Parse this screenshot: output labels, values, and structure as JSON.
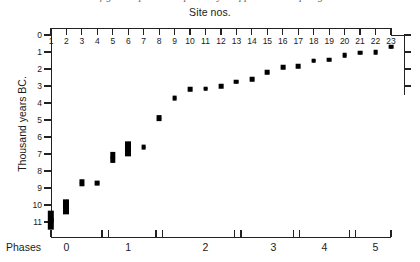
{
  "caption_clipped": "a figure caption line partially cropped at the top edge",
  "header": {
    "site_axis_title": "Site nos."
  },
  "axes": {
    "y_label": "Thousand years BC.",
    "y_ticks": [
      "0",
      "1",
      "2",
      "3",
      "4",
      "5",
      "6",
      "7",
      "8",
      "9",
      "10",
      "11"
    ],
    "y_min": 0,
    "y_max": 11,
    "y_inverted": true,
    "x_label": "Site nos.",
    "x_ticks": [
      "1",
      "2",
      "3",
      "4",
      "5",
      "6",
      "7",
      "8",
      "9",
      "10",
      "11",
      "12",
      "13",
      "14",
      "15",
      "16",
      "17",
      "18",
      "19",
      "20",
      "21",
      "22",
      "23"
    ],
    "phases_caption": "Phases",
    "phase_labels": [
      "0",
      "1",
      "2",
      "3",
      "4",
      "5"
    ]
  },
  "chart_data": {
    "type": "scatter",
    "title": "Site nos.",
    "xlabel": "Site nos.",
    "ylabel": "Thousand years BC.",
    "xlim": [
      1,
      23
    ],
    "ylim": [
      0,
      11
    ],
    "y_axis_inverted": true,
    "grid": false,
    "legend": "none",
    "marker": "vertical-diamond",
    "marker_color": "#000000",
    "categories": [
      "1",
      "2",
      "3",
      "4",
      "5",
      "6",
      "7",
      "8",
      "9",
      "10",
      "11",
      "12",
      "13",
      "14",
      "15",
      "16",
      "17",
      "18",
      "19",
      "20",
      "21",
      "22",
      "23"
    ],
    "values": [
      10.9,
      10.1,
      8.7,
      8.7,
      7.2,
      6.7,
      6.6,
      4.9,
      3.7,
      3.2,
      3.15,
      3.0,
      2.75,
      2.6,
      2.2,
      1.9,
      1.85,
      1.5,
      1.45,
      1.2,
      1.05,
      1.0,
      0.7
    ],
    "marker_half_heights": [
      0.55,
      0.45,
      0.22,
      0.14,
      0.3,
      0.45,
      0.14,
      0.17,
      0.14,
      0.12,
      0.12,
      0.12,
      0.12,
      0.12,
      0.12,
      0.12,
      0.12,
      0.12,
      0.12,
      0.12,
      0.12,
      0.12,
      0.12
    ],
    "secondary_axis": {
      "name": "Phases",
      "labels": [
        "0",
        "1",
        "2",
        "3",
        "4",
        "5"
      ],
      "label_positions_site": [
        2.0,
        6.0,
        11.0,
        15.4,
        18.7,
        22.0
      ],
      "boundaries_site": [
        1.0,
        4.3,
        4.7,
        7.8,
        8.2,
        12.9,
        13.3,
        16.7,
        17.1,
        20.3,
        20.7,
        23.0
      ]
    }
  }
}
